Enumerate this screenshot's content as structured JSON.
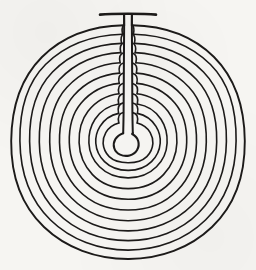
{
  "figure": {
    "style": "hand-drawn ink line drawing on paper",
    "background_color": "#f6f5f2",
    "line_color": "#1c1a19",
    "canvas": {
      "width": 256,
      "height": 270
    }
  },
  "geometry": {
    "center": {
      "x": 128,
      "y": 142
    },
    "outer_radius": 117,
    "goal_ring_radius": 9,
    "ring_count": 12,
    "axis_x": 128,
    "axis_gap_half_width": 4,
    "entrance_position": "top",
    "entrance_y": 14,
    "rings": [
      {
        "index": 1,
        "radius": 117,
        "label": "outer-wall"
      },
      {
        "index": 2,
        "radius": 108,
        "label": "ring-2"
      },
      {
        "index": 3,
        "radius": 99,
        "label": "ring-3"
      },
      {
        "index": 4,
        "radius": 90,
        "label": "ring-4"
      },
      {
        "index": 5,
        "radius": 80,
        "label": "ring-5"
      },
      {
        "index": 6,
        "radius": 70,
        "label": "ring-6"
      },
      {
        "index": 7,
        "radius": 60,
        "label": "ring-7"
      },
      {
        "index": 8,
        "radius": 50,
        "label": "ring-8"
      },
      {
        "index": 9,
        "radius": 40,
        "label": "ring-9"
      },
      {
        "index": 10,
        "radius": 31,
        "label": "ring-10"
      },
      {
        "index": 11,
        "radius": 22,
        "label": "ring-11"
      },
      {
        "index": 12,
        "radius": 9,
        "label": "goal-ring"
      }
    ],
    "stroke_widths": {
      "outer_wall": 1.9,
      "ring": 1.6,
      "axis_spine": 2.0,
      "goal_ring": 2.1
    }
  },
  "chart_data": {
    "type": "diagram",
    "rings": 12,
    "radii": [
      117,
      108,
      99,
      90,
      80,
      70,
      60,
      50,
      40,
      31,
      22,
      9
    ],
    "center": [
      128,
      142
    ],
    "entrance": "top",
    "goal": "central ring"
  }
}
